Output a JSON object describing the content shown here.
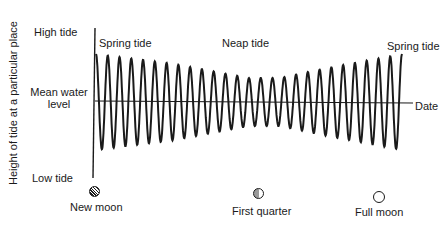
{
  "diagram": {
    "y_axis_label": "Height of tide at a particular place",
    "y_levels": {
      "high": "High tide",
      "mean_line1": "Mean water",
      "mean_line2": "level",
      "low": "Low tide"
    },
    "x_axis_label": "Date",
    "annotations": {
      "spring_start": "Spring tide",
      "neap": "Neap tide",
      "spring_end": "Spring tide"
    },
    "moon_phases": [
      {
        "label": "New moon",
        "icon": "new-moon-icon"
      },
      {
        "label": "First quarter",
        "icon": "first-quarter-icon"
      },
      {
        "label": "Full moon",
        "icon": "full-moon-icon"
      }
    ],
    "colors": {
      "line": "#1a1a1a",
      "background": "#ffffff"
    }
  },
  "chart_data": {
    "type": "line",
    "title": "",
    "xlabel": "Date",
    "ylabel": "Height of tide at a particular place",
    "cycles": 26,
    "amplitude_profile": {
      "x_fraction": [
        0.0,
        0.25,
        0.5,
        0.6,
        0.75,
        1.0
      ],
      "relative_amplitude": [
        1.0,
        0.8,
        0.5,
        0.5,
        0.7,
        1.0
      ]
    },
    "phase_markers": [
      {
        "x_fraction": 0.0,
        "label": "New moon",
        "tide": "Spring tide"
      },
      {
        "x_fraction": 0.5,
        "label": "First quarter",
        "tide": "Neap tide"
      },
      {
        "x_fraction": 1.0,
        "label": "Full moon",
        "tide": "Spring tide"
      }
    ]
  }
}
